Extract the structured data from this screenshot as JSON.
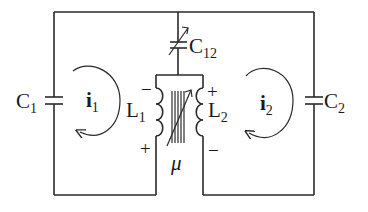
{
  "diagram": {
    "type": "coupled LC circuit",
    "components": {
      "C1": {
        "label": "C",
        "sub": "1"
      },
      "C2": {
        "label": "C",
        "sub": "2"
      },
      "C12": {
        "label": "C",
        "sub": "12",
        "variable": true
      },
      "L1": {
        "label": "L",
        "sub": "1",
        "top_sign": "−",
        "bottom_sign": "+"
      },
      "L2": {
        "label": "L",
        "sub": "2",
        "top_sign": "+",
        "bottom_sign": "−"
      },
      "core": {
        "label": "μ",
        "variable": true
      }
    },
    "currents": {
      "i1": {
        "label": "i",
        "sub": "1",
        "direction": "clockwise"
      },
      "i2": {
        "label": "i",
        "sub": "2",
        "direction": "counterclockwise"
      }
    }
  }
}
